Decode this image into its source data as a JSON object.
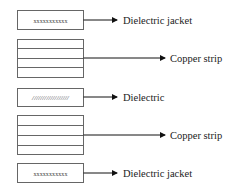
{
  "diagram": {
    "layers": [
      {
        "id": "top-jacket",
        "kind": "jacket",
        "fill_text": "xxxxxxxxxxx",
        "label": "Dielectric jacket"
      },
      {
        "id": "top-copper",
        "kind": "copper",
        "fill_text": "",
        "label": "Copper strip"
      },
      {
        "id": "dielectric",
        "kind": "dielectric",
        "fill_text": "//////////////////",
        "label": "Dielectric"
      },
      {
        "id": "bottom-copper",
        "kind": "copper",
        "fill_text": "",
        "label": "Copper strip"
      },
      {
        "id": "bottom-jacket",
        "kind": "jacket",
        "fill_text": "xxxxxxxxxxx",
        "label": "Dielectric jacket"
      }
    ]
  },
  "colors": {
    "stroke": "#555555",
    "text": "#222222"
  }
}
